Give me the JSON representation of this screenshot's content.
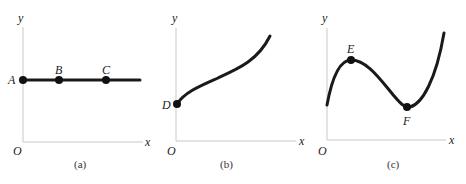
{
  "panels": [
    {
      "id": "a",
      "caption": "(a)",
      "axis_labels": {
        "x": "x",
        "y": "y",
        "origin": "O"
      },
      "curve": "horizontal line (constant y)",
      "points": [
        {
          "label": "A",
          "x": 0,
          "y": 1
        },
        {
          "label": "B",
          "x": 1,
          "y": 1
        },
        {
          "label": "C",
          "x": 2.3,
          "y": 1
        }
      ]
    },
    {
      "id": "b",
      "caption": "(b)",
      "axis_labels": {
        "x": "x",
        "y": "y",
        "origin": "O"
      },
      "curve": "increasing curve starting at D on the y-axis",
      "points": [
        {
          "label": "D",
          "x": 0,
          "y": 1
        }
      ]
    },
    {
      "id": "c",
      "caption": "(c)",
      "axis_labels": {
        "x": "x",
        "y": "y",
        "origin": "O"
      },
      "curve": "cubic-like curve with local maximum E and local minimum F",
      "points": [
        {
          "label": "E",
          "role": "local maximum"
        },
        {
          "label": "F",
          "role": "local minimum"
        }
      ]
    }
  ],
  "colors": {
    "axis": "#c8c8c8",
    "curve": "#1a1a1a",
    "text": "#222222"
  }
}
